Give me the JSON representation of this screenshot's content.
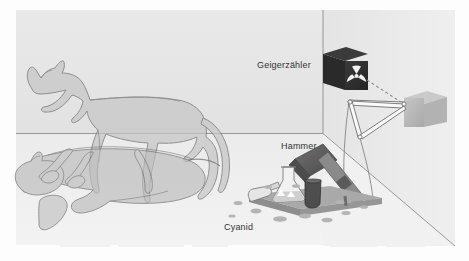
{
  "figure": {
    "language": "de",
    "labels": {
      "geiger": "Geigerzähler",
      "hammer": "Hammer",
      "cyanid": "Cyanid"
    },
    "icons": {
      "radiation": "radiation-trefoil-icon"
    },
    "colors": {
      "page_background": "#ffffff",
      "scene_background": "#ededed",
      "back_wall": "#e6e6e6",
      "side_wall": "#e0e0e0",
      "floor": "#eaeaea",
      "cat_fill": "#c9c9c9",
      "cat_outline": "#6f6f6f",
      "detector_box": "#1c1c1c",
      "detector_symbol": "#f2f2f2",
      "relay_box": "#b9b9b9",
      "hammer_head": "#5f5f5f",
      "hammer_handle": "#8a8a8a",
      "platform": "#9a9a9a",
      "flask_glass": "#f0f0f0",
      "vial_dark": "#4e4e4e",
      "puddle": "#b0b0b0",
      "line": "#7a7a7a",
      "label_text": "#333333"
    },
    "geometry": {
      "scene_left": 16,
      "scene_top": 10,
      "scene_right": 455,
      "scene_bottom": 245,
      "corner_x": 323,
      "floor_line_y": 133,
      "vanishing_diagonal_end_x": 455,
      "vanishing_diagonal_end_y": 246
    },
    "elements": [
      {
        "name": "standing-cat",
        "state": "alive",
        "description": "translucent gray cat standing in profile facing left"
      },
      {
        "name": "lying-cat",
        "state": "dead",
        "description": "translucent gray cat lying on its side, superimposed on the standing cat"
      },
      {
        "name": "geiger-counter",
        "description": "dark cube with white radiation trefoil mounted on back wall"
      },
      {
        "name": "relay-box",
        "description": "gray cube on right wall connected by dashed signal line"
      },
      {
        "name": "linkage",
        "description": "white triangular rod linkage with pivot joints"
      },
      {
        "name": "hammer",
        "description": "gray hammer poised above the cyanide flask"
      },
      {
        "name": "cyanide-flask",
        "description": "glass flask and vials on a platform with spilled puddles"
      }
    ]
  }
}
